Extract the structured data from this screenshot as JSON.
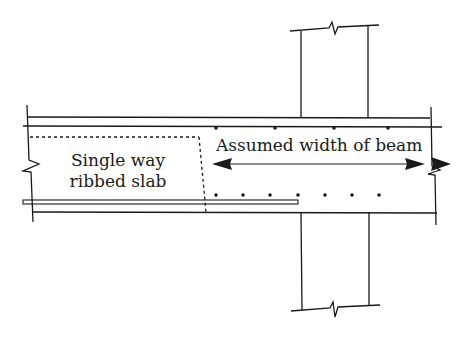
{
  "diagram": {
    "type": "structural-section",
    "labels": {
      "slab_line1": "Single way",
      "slab_line2": "ribbed slab",
      "beam_dimension": "Assumed width of beam"
    },
    "elements": {
      "column_above": "column-stub-with-break-line",
      "column_below": "column-stub-with-break-line",
      "slab": "slab-strip-with-break-lines",
      "rib_outline": "dashed-rib-outline",
      "bottom_bar": "bottom-reinforcement-bar",
      "top_bars_count": 4,
      "bottom_bars_count": 7,
      "dimension_arrow": "double-headed-arrow"
    },
    "colors": {
      "line": "#1a1a1a",
      "background": "#ffffff"
    }
  }
}
